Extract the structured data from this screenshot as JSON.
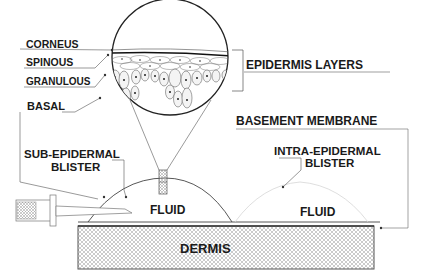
{
  "diagram": {
    "type": "medical-cross-section"
  },
  "layer_labels": {
    "corneus": "CORNEUS",
    "spinous": "SPINOUS",
    "granulous": "GRANULOUS",
    "basal": "BASAL"
  },
  "callouts": {
    "epidermis_layers": "EPIDERMIS LAYERS",
    "basement_membrane": "BASEMENT MEMBRANE",
    "sub_epidermal_line1": "SUB-EPIDERMAL",
    "sub_epidermal_line2": "BLISTER",
    "intra_epidermal_line1": "INTRA-EPIDERMAL",
    "intra_epidermal_line2": "BLISTER"
  },
  "regions": {
    "fluid_left": "FLUID",
    "fluid_right": "FLUID",
    "dermis": "DERMIS"
  },
  "colors": {
    "line": "#333333",
    "text": "#1a1a1a",
    "hatch": "#9a9a9a",
    "cell_fill": "#f4f4f4",
    "background": "#ffffff"
  }
}
